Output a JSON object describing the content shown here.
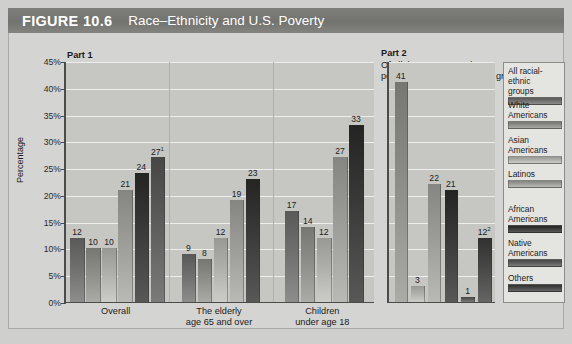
{
  "header": {
    "figure_label": "FIGURE 10.6",
    "title": "Race–Ethnicity and U.S. Poverty"
  },
  "part1": {
    "heading_bold": "Part 1",
    "heading_text": "Of these groups,\nwhat percentage is poor?"
  },
  "part2": {
    "heading_bold": "Part 2",
    "heading_text": "Of all the U.S. poor, what\npercentages are from these groups?"
  },
  "axis": {
    "ylabel": "Percentage",
    "ticks": [
      "0%",
      "5%",
      "10%",
      "15%",
      "20%",
      "25%",
      "30%",
      "35%",
      "40%",
      "45%"
    ],
    "ymin": 0,
    "ymax": 45
  },
  "legend": {
    "items": [
      {
        "label": "All racial-\nethnic\ngroups",
        "color": "#6f6f6d"
      },
      {
        "label": "White\nAmericans",
        "color": "#8c8c89"
      },
      {
        "label": "Asian\nAmericans",
        "color": "#aeaeab"
      },
      {
        "label": "Latinos",
        "color": "#9b9b98"
      },
      {
        "label": "African\nAmericans",
        "color": "#3a3a38"
      },
      {
        "label": "Native\nAmericans",
        "color": "#5c5c5a"
      },
      {
        "label": "Others",
        "color": "#474745"
      }
    ]
  },
  "chart_data": {
    "type": "bar",
    "title": "Race–Ethnicity and U.S. Poverty",
    "ylabel": "Percentage",
    "xlabel": "",
    "ylim": [
      0,
      45
    ],
    "grid": true,
    "legend_position": "right",
    "panels": [
      {
        "name": "Part 1",
        "question": "Of these groups, what percentage is poor?",
        "categories": [
          "Overall",
          "The elderly\nage 65 and over",
          "Children\nunder age 18"
        ],
        "series": [
          {
            "name": "All racial-ethnic groups",
            "color": "#6f6f6d",
            "values": [
              12,
              9,
              17
            ],
            "labels": [
              "12",
              "9",
              "17"
            ]
          },
          {
            "name": "White Americans",
            "color": "#8c8c89",
            "values": [
              10,
              8,
              14
            ],
            "labels": [
              "10",
              "8",
              "14"
            ]
          },
          {
            "name": "Asian Americans",
            "color": "#aeaeab",
            "values": [
              10,
              12,
              12
            ],
            "labels": [
              "10",
              "12",
              "12"
            ]
          },
          {
            "name": "Latinos",
            "color": "#9b9b98",
            "values": [
              21,
              19,
              27
            ],
            "labels": [
              "21",
              "19",
              "27"
            ]
          },
          {
            "name": "African Americans",
            "color": "#3a3a38",
            "values": [
              24,
              23,
              33
            ],
            "labels": [
              "24",
              "23",
              "33"
            ]
          },
          {
            "name": "Native Americans",
            "color": "#5c5c5a",
            "values": [
              27,
              null,
              null
            ],
            "labels": [
              "27¹",
              "",
              ""
            ]
          }
        ]
      },
      {
        "name": "Part 2",
        "question": "Of all the U.S. poor, what percentages are from these groups?",
        "categories": [
          ""
        ],
        "series": [
          {
            "name": "White Americans",
            "color": "#8c8c89",
            "values": [
              41
            ],
            "labels": [
              "41"
            ]
          },
          {
            "name": "Asian Americans",
            "color": "#aeaeab",
            "values": [
              3
            ],
            "labels": [
              "3"
            ]
          },
          {
            "name": "Latinos",
            "color": "#9b9b98",
            "values": [
              22
            ],
            "labels": [
              "22"
            ]
          },
          {
            "name": "African Americans",
            "color": "#3a3a38",
            "values": [
              21
            ],
            "labels": [
              "21"
            ]
          },
          {
            "name": "Native Americans",
            "color": "#5c5c5a",
            "values": [
              1
            ],
            "labels": [
              "1"
            ]
          },
          {
            "name": "Others",
            "color": "#474745",
            "values": [
              12
            ],
            "labels": [
              "12²"
            ]
          }
        ]
      }
    ]
  }
}
